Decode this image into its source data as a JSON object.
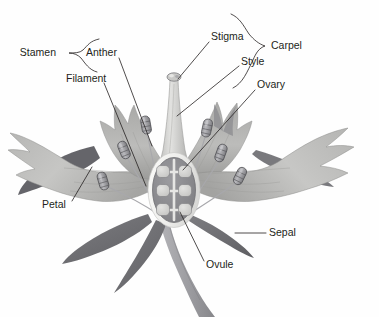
{
  "figure": {
    "background_color": "#fefefe",
    "line_color": "#231f20",
    "label_font_size_px": 10.5
  },
  "palette": {
    "petal_light": "#c9c9c7",
    "petal_mid": "#b0b0ae",
    "petal_shade": "#9a9a98",
    "petal_dark": "#86868a",
    "sepal_dark": "#6f6f73",
    "sepal_darkest": "#5d5d61",
    "stem": "#9e9ea2",
    "style_light": "#dcdcda",
    "ovary_rim": "#f3f3f1",
    "ovary_inner": "#8f8f93",
    "ovule": "#d6d6d4",
    "anther": "#8c8c90",
    "filament": "#a8a8ac",
    "outline": "#231f20"
  },
  "labels": [
    {
      "id": "stamen",
      "text": "Stamen",
      "x": 56,
      "y": 53,
      "anchor": "end",
      "kind": "group"
    },
    {
      "id": "anther",
      "text": "Anther",
      "x": 86,
      "y": 53,
      "anchor": "start",
      "kind": "part"
    },
    {
      "id": "filament",
      "text": "Filament",
      "x": 66,
      "y": 79,
      "anchor": "start",
      "kind": "part"
    },
    {
      "id": "stigma",
      "text": "Stigma",
      "x": 211,
      "y": 37,
      "anchor": "start",
      "kind": "part"
    },
    {
      "id": "carpel",
      "text": "Carpel",
      "x": 271,
      "y": 46,
      "anchor": "start",
      "kind": "group"
    },
    {
      "id": "style",
      "text": "Style",
      "x": 241,
      "y": 62,
      "anchor": "start",
      "kind": "part"
    },
    {
      "id": "ovary",
      "text": "Ovary",
      "x": 257,
      "y": 85,
      "anchor": "start",
      "kind": "part"
    },
    {
      "id": "petal",
      "text": "Petal",
      "x": 42,
      "y": 205,
      "anchor": "start",
      "kind": "part"
    },
    {
      "id": "sepal",
      "text": "Sepal",
      "x": 269,
      "y": 233,
      "anchor": "start",
      "kind": "part"
    },
    {
      "id": "ovule",
      "text": "Ovule",
      "x": 206,
      "y": 265,
      "anchor": "start",
      "kind": "part"
    }
  ],
  "leader_lines": [
    {
      "id": "anther-leader",
      "from_label": "anther",
      "path": "M 119 58 L 152 146"
    },
    {
      "id": "filament-leader",
      "from_label": "filament",
      "path": "M 104 83 L 146 186"
    },
    {
      "id": "stigma-leader",
      "from_label": "stigma",
      "path": "M 209 42 L 178 79"
    },
    {
      "id": "style-leader",
      "from_label": "style",
      "path": "M 239 66 L 177 116"
    },
    {
      "id": "ovary-leader",
      "from_label": "ovary",
      "path": "M 255 90 L 183 170"
    },
    {
      "id": "petal-leader",
      "from_label": "petal",
      "path": "M 72 201 L 92 167"
    },
    {
      "id": "sepal-leader",
      "from_label": "sepal",
      "path": "M 266 233 L 235 233"
    },
    {
      "id": "ovule-leader",
      "from_label": "ovule",
      "path": "M 204 261 L 180 212"
    }
  ],
  "braces": [
    {
      "id": "stamen-brace",
      "label": "stamen",
      "groups": [
        "anther",
        "filament"
      ],
      "path": "M 99 39 C 90 41 88 45 83 50 C 80 53 74 53 69 53 C 74 53 78 55 81 58 C 85 63 89 70 97 72"
    },
    {
      "id": "carpel-brace",
      "label": "carpel",
      "groups": [
        "stigma",
        "style",
        "ovary"
      ],
      "path": "M 231 14 C 240 18 243 25 249 34 C 254 40 259 44 265 46 C 259 48 256 53 253 60 C 247 72 243 83 233 88"
    }
  ],
  "flower_parts": {
    "petals": [
      {
        "id": "petal-left-outer",
        "name": "left outer petal"
      },
      {
        "id": "petal-left-upper",
        "name": "left upper petal"
      },
      {
        "id": "petal-right-upper",
        "name": "right upper petal"
      },
      {
        "id": "petal-right-outer",
        "name": "right outer petal"
      }
    ],
    "sepals": [
      {
        "id": "sepal-left-tip",
        "name": "left sepal tip"
      },
      {
        "id": "sepal-lower-left",
        "name": "lower left sepal"
      },
      {
        "id": "sepal-lower-mid",
        "name": "lower middle sepal"
      },
      {
        "id": "sepal-lower-right",
        "name": "lower right sepal"
      },
      {
        "id": "sepal-right-tip",
        "name": "right sepal tip"
      }
    ],
    "stamens": [
      {
        "id": "stamen-1",
        "anther_x": 124,
        "anther_y": 150,
        "angle": -22
      },
      {
        "id": "stamen-2",
        "anther_x": 103,
        "anther_y": 181,
        "angle": -16
      },
      {
        "id": "stamen-3",
        "anther_x": 146,
        "anther_y": 125,
        "angle": -10
      },
      {
        "id": "stamen-4",
        "anther_x": 207,
        "anther_y": 128,
        "angle": 12
      },
      {
        "id": "stamen-5",
        "anther_x": 221,
        "anther_y": 153,
        "angle": 20
      },
      {
        "id": "stamen-6",
        "anther_x": 240,
        "anther_y": 176,
        "angle": 26
      }
    ],
    "carpel": {
      "stigma": {
        "cx": 174,
        "cy": 77,
        "rx": 6.5,
        "ry": 4
      },
      "style": {
        "top_y": 82,
        "bottom_y": 160
      },
      "ovary": {
        "cx": 174,
        "cy": 190,
        "rx": 26,
        "ry": 37
      },
      "ovules": {
        "count": 6,
        "rows": 3,
        "columns": 2,
        "positions": [
          {
            "cx": 163,
            "cy": 172
          },
          {
            "cx": 185,
            "cy": 172
          },
          {
            "cx": 163,
            "cy": 191
          },
          {
            "cx": 185,
            "cy": 191
          },
          {
            "cx": 163,
            "cy": 210
          },
          {
            "cx": 185,
            "cy": 210
          }
        ]
      }
    },
    "stem": {
      "id": "stem",
      "name": "flower stem"
    }
  }
}
